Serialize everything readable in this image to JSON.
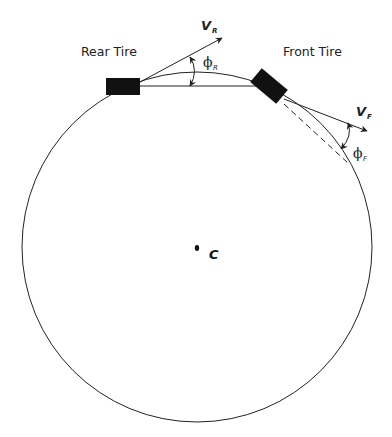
{
  "diagram": {
    "labels": {
      "rear_tire": "Rear Tire",
      "front_tire": "Front Tire",
      "v_rear": "V",
      "v_rear_sub": "R",
      "v_front": "V",
      "v_front_sub": "F",
      "phi_rear": "ϕ",
      "phi_rear_sub": "R",
      "phi_front": "ϕ",
      "phi_front_sub": "F",
      "center": "C"
    },
    "colors": {
      "stroke": "#222222",
      "tire_fill": "#111111",
      "background": "#ffffff"
    },
    "geometry": {
      "circle": {
        "cx": 197,
        "cy": 247,
        "r": 175
      },
      "rear_tire": {
        "x": 106,
        "y": 78,
        "w": 34,
        "h": 17
      },
      "front_tire": {
        "cx": 269,
        "cy": 86,
        "w": 34,
        "h": 18,
        "rotation_deg": 40
      },
      "center_point": {
        "x": 197,
        "y": 248
      }
    }
  }
}
